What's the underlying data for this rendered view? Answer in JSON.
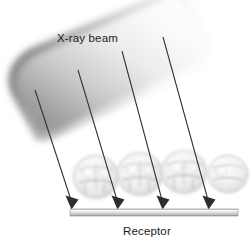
{
  "figure": {
    "type": "radiographic-geometry-diagram",
    "width": 251,
    "height": 246,
    "background_color": "#ffffff"
  },
  "labels": {
    "beam": "X-ray beam",
    "receptor": "Receptor"
  },
  "colors": {
    "label_text": "#1a1a1a",
    "arrow_stroke": "#333333",
    "beam_dark": "#7d7d7d",
    "beam_light": "#ffffff",
    "receptor_light": "#f2f2f2",
    "receptor_mid": "#c9c9c9",
    "receptor_edge": "#8d8d8d",
    "tooth_outline": "#c4c4c4",
    "tooth_fill": "#efefef"
  },
  "beam": {
    "name": "x-ray-beam-band",
    "description": "Tilted rectangular band with rounded left end, dark gray at lower-left fading to white toward upper-right",
    "rotation_deg": -13,
    "gradient_stops": [
      {
        "offset": 0,
        "color": "#8a8a8a"
      },
      {
        "offset": 0.22,
        "color": "#a8a8a8"
      },
      {
        "offset": 0.5,
        "color": "#d8d8d8"
      },
      {
        "offset": 0.78,
        "color": "#f4f4f4"
      },
      {
        "offset": 1,
        "color": "#ffffff"
      }
    ]
  },
  "rays": [
    {
      "name": "ray-1",
      "x1": 35,
      "y1": 90,
      "x2": 72,
      "y2": 208
    },
    {
      "name": "ray-2",
      "x1": 78,
      "y1": 70,
      "x2": 118,
      "y2": 208
    },
    {
      "name": "ray-3",
      "x1": 122,
      "y1": 51,
      "x2": 163,
      "y2": 208
    },
    {
      "name": "ray-4",
      "x1": 163,
      "y1": 37,
      "x2": 209,
      "y2": 208
    }
  ],
  "teeth": [
    {
      "name": "molar-1",
      "cx": 96,
      "cy": 177,
      "rx": 22,
      "ry": 21
    },
    {
      "name": "molar-2",
      "cx": 140,
      "cy": 174,
      "rx": 22,
      "ry": 21
    },
    {
      "name": "molar-3",
      "cx": 184,
      "cy": 172,
      "rx": 22,
      "ry": 21
    },
    {
      "name": "molar-4",
      "cx": 227,
      "cy": 174,
      "rx": 20,
      "ry": 19
    }
  ],
  "receptor": {
    "name": "receptor-bar",
    "x": 70,
    "y": 209,
    "width": 168,
    "height": 7
  }
}
